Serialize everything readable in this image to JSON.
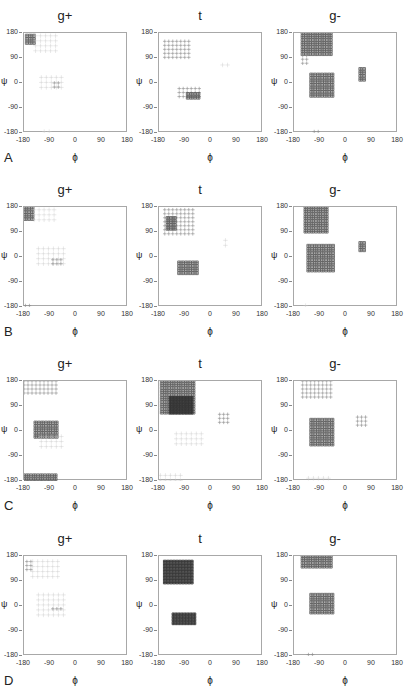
{
  "figure": {
    "row_labels": [
      "A",
      "B",
      "C",
      "D"
    ],
    "column_titles": [
      "g+",
      "t",
      "g-"
    ],
    "x_axis_label": "ϕ",
    "y_axis_label": "ψ",
    "x_ticks": [
      "-180",
      "-90",
      "0",
      "90",
      "180"
    ],
    "y_ticks": [
      "180",
      "90",
      "0",
      "-90",
      "-180"
    ]
  },
  "chart_data": {
    "type": "scatter",
    "xlabel": "ϕ",
    "ylabel": "ψ",
    "xlim": [
      -180,
      180
    ],
    "ylim": [
      -180,
      180
    ],
    "xticks": [
      -180,
      -90,
      0,
      90,
      180
    ],
    "yticks": [
      -180,
      -90,
      0,
      90,
      180
    ],
    "grid": false,
    "legend": "none",
    "marker_encoding": "denser/darker crossed-square markers indicate higher population",
    "panels": [
      {
        "row": "A",
        "column": "g+",
        "regions": [
          {
            "phi": [
              -170,
              -140
            ],
            "psi": [
              140,
              170
            ],
            "density": "high"
          },
          {
            "phi": [
              -140,
              -60
            ],
            "psi": [
              110,
              170
            ],
            "density": "low"
          },
          {
            "phi": [
              -120,
              -40
            ],
            "psi": [
              -30,
              20
            ],
            "density": "low"
          },
          {
            "phi": [
              -75,
              -55
            ],
            "psi": [
              -20,
              0
            ],
            "density": "medium"
          },
          {
            "phi": [
              -110,
              -90
            ],
            "psi": [
              -180,
              -175
            ],
            "density": "low"
          }
        ]
      },
      {
        "row": "A",
        "column": "t",
        "regions": [
          {
            "phi": [
              -160,
              -70
            ],
            "psi": [
              80,
              150
            ],
            "density": "medium"
          },
          {
            "phi": [
              -110,
              -40
            ],
            "psi": [
              -60,
              -20
            ],
            "density": "medium"
          },
          {
            "phi": [
              -80,
              -40
            ],
            "psi": [
              -60,
              -40
            ],
            "density": "high"
          },
          {
            "phi": [
              40,
              60
            ],
            "psi": [
              50,
              65
            ],
            "density": "low"
          }
        ]
      },
      {
        "row": "A",
        "column": "g-",
        "regions": [
          {
            "phi": [
              -150,
              -50
            ],
            "psi": [
              100,
              180
            ],
            "density": "high"
          },
          {
            "phi": [
              -150,
              -130
            ],
            "psi": [
              60,
              100
            ],
            "density": "medium"
          },
          {
            "phi": [
              -120,
              -40
            ],
            "psi": [
              -50,
              30
            ],
            "density": "high"
          },
          {
            "phi": [
              50,
              70
            ],
            "psi": [
              10,
              50
            ],
            "density": "high"
          },
          {
            "phi": [
              -110,
              -90
            ],
            "psi": [
              -180,
              -175
            ],
            "density": "medium"
          }
        ]
      },
      {
        "row": "B",
        "column": "g+",
        "regions": [
          {
            "phi": [
              -175,
              -145
            ],
            "psi": [
              130,
              175
            ],
            "density": "high"
          },
          {
            "phi": [
              -145,
              -60
            ],
            "psi": [
              120,
              170
            ],
            "density": "low"
          },
          {
            "phi": [
              -130,
              -40
            ],
            "psi": [
              -40,
              30
            ],
            "density": "low"
          },
          {
            "phi": [
              -80,
              -50
            ],
            "psi": [
              -30,
              -10
            ],
            "density": "medium"
          },
          {
            "phi": [
              -175,
              -160
            ],
            "psi": [
              -180,
              -175
            ],
            "density": "medium"
          }
        ]
      },
      {
        "row": "B",
        "column": "t",
        "regions": [
          {
            "phi": [
              -160,
              -60
            ],
            "psi": [
              80,
              170
            ],
            "density": "medium"
          },
          {
            "phi": [
              -150,
              -120
            ],
            "psi": [
              100,
              140
            ],
            "density": "high"
          },
          {
            "phi": [
              -110,
              -40
            ],
            "psi": [
              -70,
              -20
            ],
            "density": "high"
          },
          {
            "phi": [
              50,
              60
            ],
            "psi": [
              40,
              60
            ],
            "density": "low"
          }
        ]
      },
      {
        "row": "B",
        "column": "g-",
        "regions": [
          {
            "phi": [
              -140,
              -60
            ],
            "psi": [
              80,
              180
            ],
            "density": "high"
          },
          {
            "phi": [
              -130,
              -40
            ],
            "psi": [
              -60,
              40
            ],
            "density": "high"
          },
          {
            "phi": [
              50,
              70
            ],
            "psi": [
              20,
              50
            ],
            "density": "high"
          },
          {
            "phi": [
              -140,
              -135
            ],
            "psi": [
              -180,
              -175
            ],
            "density": "low"
          }
        ]
      },
      {
        "row": "C",
        "column": "g+",
        "regions": [
          {
            "phi": [
              -180,
              -60
            ],
            "psi": [
              130,
              180
            ],
            "density": "medium"
          },
          {
            "phi": [
              -140,
              -60
            ],
            "psi": [
              -30,
              30
            ],
            "density": "high"
          },
          {
            "phi": [
              -120,
              -40
            ],
            "psi": [
              -60,
              -20
            ],
            "density": "low"
          },
          {
            "phi": [
              -180,
              -60
            ],
            "psi": [
              -180,
              -160
            ],
            "density": "high"
          }
        ]
      },
      {
        "row": "C",
        "column": "t",
        "regions": [
          {
            "phi": [
              -170,
              -60
            ],
            "psi": [
              60,
              180
            ],
            "density": "high"
          },
          {
            "phi": [
              -140,
              -60
            ],
            "psi": [
              60,
              120
            ],
            "density": "very high"
          },
          {
            "phi": [
              30,
              60
            ],
            "psi": [
              20,
              60
            ],
            "density": "medium"
          },
          {
            "phi": [
              -120,
              -30
            ],
            "psi": [
              -60,
              -10
            ],
            "density": "low"
          },
          {
            "phi": [
              -175,
              -100
            ],
            "psi": [
              -180,
              -160
            ],
            "density": "low"
          }
        ]
      },
      {
        "row": "C",
        "column": "g-",
        "regions": [
          {
            "phi": [
              -150,
              -40
            ],
            "psi": [
              120,
              180
            ],
            "density": "medium"
          },
          {
            "phi": [
              -120,
              -40
            ],
            "psi": [
              -60,
              40
            ],
            "density": "high"
          },
          {
            "phi": [
              40,
              70
            ],
            "psi": [
              10,
              50
            ],
            "density": "medium"
          },
          {
            "phi": [
              -130,
              -60
            ],
            "psi": [
              -180,
              -170
            ],
            "density": "low"
          }
        ]
      },
      {
        "row": "D",
        "column": "g+",
        "regions": [
          {
            "phi": [
              -170,
              -150
            ],
            "psi": [
              130,
              160
            ],
            "density": "medium"
          },
          {
            "phi": [
              -150,
              -50
            ],
            "psi": [
              100,
              160
            ],
            "density": "low"
          },
          {
            "phi": [
              -130,
              -40
            ],
            "psi": [
              -40,
              40
            ],
            "density": "low"
          },
          {
            "phi": [
              -80,
              -50
            ],
            "psi": [
              -20,
              -10
            ],
            "density": "medium"
          }
        ]
      },
      {
        "row": "D",
        "column": "t",
        "regions": [
          {
            "phi": [
              -160,
              -60
            ],
            "psi": [
              80,
              160
            ],
            "density": "very high"
          },
          {
            "phi": [
              -130,
              -50
            ],
            "psi": [
              -70,
              -30
            ],
            "density": "very high"
          }
        ]
      },
      {
        "row": "D",
        "column": "g-",
        "regions": [
          {
            "phi": [
              -150,
              -50
            ],
            "psi": [
              140,
              180
            ],
            "density": "high"
          },
          {
            "phi": [
              -120,
              -40
            ],
            "psi": [
              -30,
              40
            ],
            "density": "high"
          },
          {
            "phi": [
              -130,
              -110
            ],
            "psi": [
              -180,
              -175
            ],
            "density": "medium"
          }
        ]
      }
    ]
  }
}
